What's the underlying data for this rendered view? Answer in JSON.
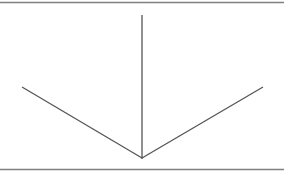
{
  "diagram": {
    "colors": {
      "background": "#ffffff",
      "line": "#555555",
      "rule": "#808080"
    },
    "segments": [
      {
        "name": "left-diagonal-segment",
        "direction": "up-left"
      },
      {
        "name": "vertical-segment",
        "direction": "up"
      },
      {
        "name": "right-diagonal-segment",
        "direction": "up-right"
      }
    ],
    "rules": [
      {
        "name": "top-rule"
      },
      {
        "name": "bottom-rule"
      }
    ]
  }
}
